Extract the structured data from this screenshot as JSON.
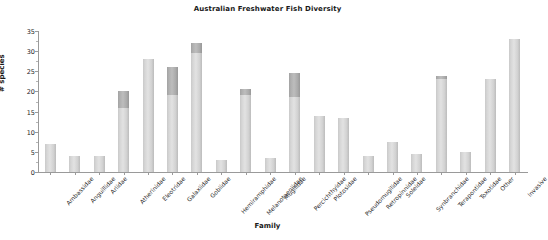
{
  "chart_data": {
    "type": "bar",
    "title": "Australian Freshwater Fish Diversity",
    "xlabel": "Family",
    "ylabel": "# species",
    "ylim": [
      0,
      35
    ],
    "yticks": [
      0,
      5,
      10,
      15,
      20,
      25,
      30,
      35
    ],
    "grid": false,
    "legend_position": "none",
    "stacked": true,
    "categories": [
      "Ambassidae",
      "Anguillidae",
      "Ariidae",
      "Atherinidae",
      "Eleotridae",
      "Galaxiidae",
      "Gobiidae",
      "Hemiramphidae",
      "Melanotaeniidae",
      "Mugilidae",
      "Percichthyidae",
      "Plotosidae",
      "Pseudomugilidae",
      "Retropinnidae",
      "Soleidae",
      "Synbranchidae",
      "Terapontidae",
      "Toxotidae",
      "Other",
      "Invasive"
    ],
    "series": [
      {
        "name": "base",
        "values": [
          7,
          4,
          4,
          16,
          28,
          19,
          29.5,
          3,
          19,
          3.5,
          18.5,
          14,
          13.5,
          4,
          7.5,
          4.5,
          23,
          5,
          23,
          33
        ]
      },
      {
        "name": "top",
        "values": [
          0,
          0,
          0,
          4,
          0,
          7,
          2.5,
          0,
          1.5,
          0,
          6,
          0,
          0,
          0,
          0,
          0,
          0.8,
          0,
          0,
          0
        ]
      }
    ],
    "totals": [
      7,
      4,
      4,
      20,
      28,
      26,
      32,
      3,
      20.5,
      3.5,
      24.5,
      14,
      13.5,
      4,
      7.5,
      4.5,
      23.8,
      5,
      23,
      33
    ],
    "colors": {
      "base": "#d6d6d6",
      "top": "#ababab",
      "axis": "#9a9a9a",
      "text": "#1a1a1a"
    }
  }
}
